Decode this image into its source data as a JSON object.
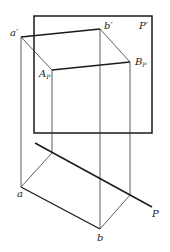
{
  "diagram": {
    "labels": {
      "a_prime": "a′",
      "b_prime": "b′",
      "plane_prime": "P′",
      "A_P_main": "A",
      "A_P_sub": "P",
      "B_P_main": "B",
      "B_P_sub": "P",
      "a": "a",
      "b": "b",
      "plane": "P"
    },
    "colors": {
      "line": "#1a1a1a",
      "thin": "#333333",
      "background": "#ffffff"
    }
  }
}
